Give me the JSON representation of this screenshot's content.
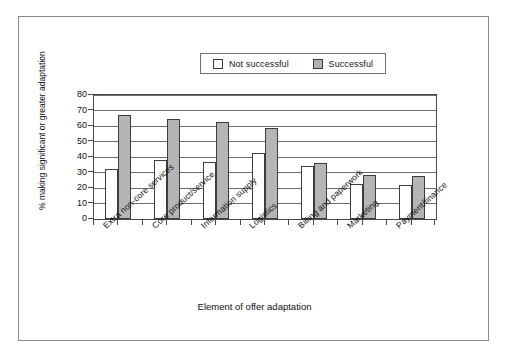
{
  "chart_data": {
    "type": "bar",
    "title": "",
    "xlabel": "Element of offer adaptation",
    "ylabel": "% making significant or greater adaptation",
    "ylim": [
      0,
      80
    ],
    "ytick_step": 10,
    "yticks": [
      "0",
      "10",
      "20",
      "30",
      "40",
      "50",
      "60",
      "70",
      "80"
    ],
    "grid": true,
    "legend_position": "top-center",
    "categories": [
      "Extra non-core services",
      "Core product/service",
      "Information supply",
      "Logistics",
      "Billing and paperwork",
      "Marketing",
      "Payment/finance"
    ],
    "series": [
      {
        "name": "Not successful",
        "color": "#ffffff",
        "values": [
          32,
          38,
          37,
          42.5,
          34.5,
          22.5,
          22
        ]
      },
      {
        "name": "Successful",
        "color": "#b5b5b5",
        "values": [
          67,
          64.5,
          62.5,
          59,
          36,
          28.5,
          28
        ]
      }
    ]
  },
  "legend": {
    "items": [
      {
        "label": "Not successful",
        "swatch": "white-square-icon"
      },
      {
        "label": "Successful",
        "swatch": "gray-square-icon"
      }
    ]
  }
}
